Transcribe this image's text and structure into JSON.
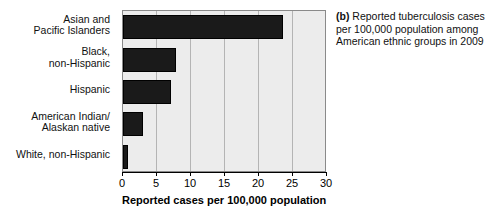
{
  "figure": {
    "caption_tag": "(b)",
    "caption_text": "Reported tuberculosis cases per 100,000 population among American ethnic groups in 2009"
  },
  "axis": {
    "x_title": "Reported cases per 100,000 population",
    "tick_labels": [
      "0",
      "5",
      "10",
      "15",
      "20",
      "25",
      "30"
    ]
  },
  "chart_data": {
    "type": "bar",
    "orientation": "horizontal",
    "title": "",
    "categories": [
      "Asian and Pacific Islanders",
      "Black, non-Hispanic",
      "Hispanic",
      "American Indian/ Alaskan native",
      "White, non-Hispanic"
    ],
    "category_lines": [
      [
        "Asian and",
        "Pacific Islanders"
      ],
      [
        "Black,",
        "non-Hispanic"
      ],
      [
        "Hispanic"
      ],
      [
        "American Indian/",
        "Alaskan native"
      ],
      [
        "White, non-Hispanic"
      ]
    ],
    "values": [
      23.6,
      7.8,
      7.1,
      2.9,
      0.7
    ],
    "xlabel": "Reported cases per 100,000 population",
    "ylabel": "",
    "xlim": [
      0,
      30
    ],
    "xticks": [
      0,
      5,
      10,
      15,
      20,
      25,
      30
    ],
    "grid": "vertical",
    "legend": "none",
    "bar_color": "#1a1a1a",
    "plot_background": "#ececec",
    "gridline_color": "#b4b4b4"
  }
}
